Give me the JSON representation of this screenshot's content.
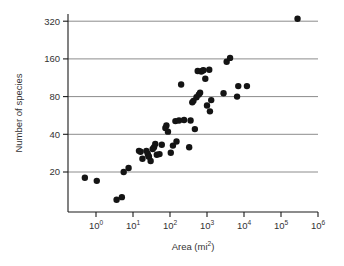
{
  "chart_data": {
    "type": "scatter",
    "title": "",
    "xlabel": "Area (mi2)",
    "xlabel_base": "Area (mi",
    "xlabel_sup": "2",
    "xlabel_tail": ")",
    "ylabel": "Number of species",
    "xscale": "log10",
    "yscale": "log2",
    "xlim": [
      0.2,
      1000000
    ],
    "ylim": [
      8,
      420
    ],
    "grid": "horizontal",
    "legend": "none",
    "xticks": [
      1,
      10,
      100,
      1000,
      10000,
      100000,
      1000000
    ],
    "xtick_labels": [
      "10^0",
      "10^1",
      "10^2",
      "10^3",
      "10^4",
      "10^5",
      "10^6"
    ],
    "xtick_mantissa": [
      "10",
      "10",
      "10",
      "10",
      "10",
      "10",
      "10"
    ],
    "xtick_exponents": [
      "0",
      "1",
      "2",
      "3",
      "4",
      "5",
      "6"
    ],
    "yticks": [
      20,
      40,
      80,
      160,
      320
    ],
    "ytick_labels": [
      "20",
      "40",
      "80",
      "160",
      "320"
    ],
    "marker": "filled-circle",
    "marker_color": "#141414",
    "marker_size_px": 4.4,
    "n_points": 55,
    "points": [
      {
        "x": 0.5,
        "y": 18
      },
      {
        "x": 1.05,
        "y": 17
      },
      {
        "x": 3.6,
        "y": 12
      },
      {
        "x": 5.0,
        "y": 12.6
      },
      {
        "x": 5.6,
        "y": 20
      },
      {
        "x": 7.6,
        "y": 21.5
      },
      {
        "x": 14.5,
        "y": 29.5
      },
      {
        "x": 16.0,
        "y": 29.0
      },
      {
        "x": 18.0,
        "y": 25.5
      },
      {
        "x": 23.0,
        "y": 29.5
      },
      {
        "x": 25.0,
        "y": 28.0
      },
      {
        "x": 26.0,
        "y": 27.0
      },
      {
        "x": 27.0,
        "y": 26.5
      },
      {
        "x": 30.0,
        "y": 24.5
      },
      {
        "x": 34.0,
        "y": 30.5
      },
      {
        "x": 37.0,
        "y": 31.5
      },
      {
        "x": 40.0,
        "y": 33.5
      },
      {
        "x": 44.0,
        "y": 27.5
      },
      {
        "x": 52.0,
        "y": 27.8
      },
      {
        "x": 60.0,
        "y": 33.0
      },
      {
        "x": 75.0,
        "y": 45.0
      },
      {
        "x": 80.0,
        "y": 47.0
      },
      {
        "x": 88.0,
        "y": 42.0
      },
      {
        "x": 105.0,
        "y": 28.5
      },
      {
        "x": 120.0,
        "y": 32.5
      },
      {
        "x": 140.0,
        "y": 51.0
      },
      {
        "x": 150.0,
        "y": 35.0
      },
      {
        "x": 175.0,
        "y": 51.5
      },
      {
        "x": 200.0,
        "y": 100.0
      },
      {
        "x": 240.0,
        "y": 52.0
      },
      {
        "x": 330.0,
        "y": 31.5
      },
      {
        "x": 360.0,
        "y": 51.5
      },
      {
        "x": 400.0,
        "y": 72.0
      },
      {
        "x": 430.0,
        "y": 74.0
      },
      {
        "x": 470.0,
        "y": 44.0
      },
      {
        "x": 520.0,
        "y": 79.0
      },
      {
        "x": 560.0,
        "y": 128.0
      },
      {
        "x": 600.0,
        "y": 83.0
      },
      {
        "x": 650.0,
        "y": 86.0
      },
      {
        "x": 700.0,
        "y": 127.0
      },
      {
        "x": 760.0,
        "y": 129.0
      },
      {
        "x": 800.0,
        "y": 130.0
      },
      {
        "x": 900.0,
        "y": 111.0
      },
      {
        "x": 1000.0,
        "y": 68.0
      },
      {
        "x": 1150.0,
        "y": 131.0
      },
      {
        "x": 1200.0,
        "y": 61.0
      },
      {
        "x": 1300.0,
        "y": 75.0
      },
      {
        "x": 2800.0,
        "y": 85.0
      },
      {
        "x": 3400.0,
        "y": 152.0
      },
      {
        "x": 4200.0,
        "y": 163.0
      },
      {
        "x": 6500.0,
        "y": 80.0
      },
      {
        "x": 7000.0,
        "y": 97.0
      },
      {
        "x": 12000.0,
        "y": 97.0
      },
      {
        "x": 280000.0,
        "y": 335.0
      }
    ]
  }
}
